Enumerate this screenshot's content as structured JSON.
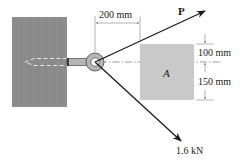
{
  "diagram": {
    "type": "statics-free-body",
    "elements": {
      "wall": {
        "label": "",
        "color": "#8c8c8c"
      },
      "eye_bolt": {
        "label": "",
        "color": "#b5b5b5"
      },
      "block": {
        "label": "A",
        "color": "#c9c9c9"
      },
      "force_p": {
        "label": "P"
      },
      "force_known": {
        "label": "1.6 kN"
      }
    },
    "dimensions": {
      "horizontal": "200 mm",
      "upper": "100 mm",
      "lower": "150 mm"
    },
    "colors": {
      "line": "#1a1a1a",
      "dim_line": "#666666",
      "background": "#ffffff"
    }
  }
}
